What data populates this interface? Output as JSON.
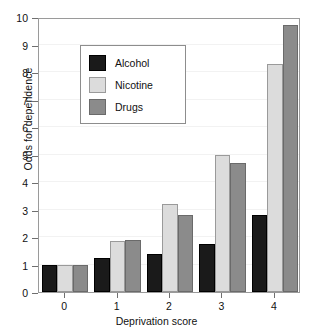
{
  "chart_data": {
    "type": "bar",
    "title": "",
    "xlabel": "Deprivation score",
    "ylabel": "Odds for dependence",
    "categories": [
      "0",
      "1",
      "2",
      "3",
      "4"
    ],
    "ylim": [
      0,
      10
    ],
    "yticks": [
      0,
      1,
      2,
      3,
      4,
      5,
      6,
      7,
      8,
      9,
      10
    ],
    "ytick_labels": [
      "0",
      "1",
      "2",
      "3",
      "4",
      "5",
      "6",
      "7",
      "8",
      "9",
      "10"
    ],
    "grid": true,
    "legend_position": "upper-left-inside",
    "series": [
      {
        "name": "Alcohol",
        "color": "#1a1a1a",
        "values": [
          1.0,
          1.25,
          1.4,
          1.75,
          2.8
        ]
      },
      {
        "name": "Nicotine",
        "color": "#dcdcdc",
        "values": [
          1.0,
          1.85,
          3.2,
          5.0,
          8.3
        ]
      },
      {
        "name": "Drugs",
        "color": "#8b8b8b",
        "values": [
          1.0,
          1.9,
          2.8,
          4.7,
          9.7
        ]
      }
    ]
  },
  "axes": {
    "y_title": "Odds for dependence",
    "x_title": "Deprivation score"
  },
  "legend": {
    "items": [
      {
        "label": "Alcohol",
        "swatch": "alcohol"
      },
      {
        "label": "Nicotine",
        "swatch": "nicotine"
      },
      {
        "label": "Drugs",
        "swatch": "drugs"
      }
    ]
  }
}
